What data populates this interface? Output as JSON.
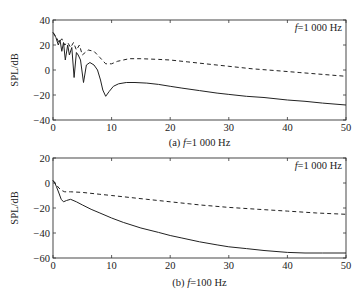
{
  "chart_data": [
    {
      "type": "line",
      "panel": "a",
      "caption_prefix": "(a)",
      "caption_var": "f",
      "caption_value": "=1 000 Hz",
      "annotation_var": "f",
      "annotation_value": "=1 000 Hz",
      "xlabel": "",
      "ylabel": "SPL/dB",
      "xlim": [
        0,
        50
      ],
      "ylim": [
        -40,
        40
      ],
      "xticks": [
        0,
        10,
        20,
        30,
        40,
        50
      ],
      "yticks": [
        -40,
        -20,
        0,
        20,
        40
      ],
      "grid": false,
      "series": [
        {
          "name": "solid",
          "style": "solid",
          "x": [
            0,
            0.5,
            0.9,
            1.2,
            1.5,
            1.8,
            2.1,
            2.5,
            2.8,
            3.2,
            3.6,
            4.0,
            4.3,
            4.7,
            5.2,
            5.7,
            6.3,
            7.0,
            7.6,
            8.1,
            8.5,
            9.0,
            9.6,
            10.3,
            11.2,
            12.5,
            14,
            16,
            18,
            20,
            22,
            25,
            28,
            30,
            33,
            36,
            40,
            43,
            46,
            50
          ],
          "y": [
            30,
            26,
            20,
            24,
            15,
            22,
            8,
            20,
            12,
            18,
            -6,
            14,
            12,
            8,
            -10,
            4,
            6,
            4,
            0,
            -8,
            -16,
            -21,
            -17,
            -13,
            -11,
            -10,
            -10,
            -10.5,
            -11.5,
            -13,
            -14.5,
            -16.5,
            -18.5,
            -19.5,
            -21,
            -22,
            -24,
            -25,
            -26.5,
            -28
          ]
        },
        {
          "name": "dashed",
          "style": "dashed",
          "x": [
            0,
            0.5,
            1.0,
            1.5,
            2.0,
            2.5,
            3.0,
            3.5,
            4.0,
            4.5,
            5.0,
            5.5,
            6,
            7,
            8,
            9,
            10,
            11,
            12,
            13,
            15,
            18,
            20,
            23,
            26,
            30,
            34,
            38,
            42,
            46,
            50
          ],
          "y": [
            30,
            27,
            22,
            25,
            20,
            22,
            18,
            22,
            16,
            20,
            12,
            14,
            16,
            15,
            10,
            5,
            5,
            7,
            8,
            9,
            9,
            8.5,
            8,
            6.5,
            5,
            3,
            1,
            -0.5,
            -2,
            -3.5,
            -5
          ]
        }
      ]
    },
    {
      "type": "line",
      "panel": "b",
      "caption_prefix": "(b)",
      "caption_var": "f",
      "caption_value": "=100 Hz",
      "annotation_var": "f",
      "annotation_value": "=1 000 Hz",
      "xlabel": "",
      "ylabel": "SPL/dB",
      "xlim": [
        0,
        50
      ],
      "ylim": [
        -60,
        20
      ],
      "xticks": [
        0,
        10,
        20,
        30,
        40,
        50
      ],
      "yticks": [
        -60,
        -40,
        -20,
        0,
        20
      ],
      "grid": false,
      "series": [
        {
          "name": "solid",
          "style": "solid",
          "x": [
            0,
            0.3,
            0.6,
            1.0,
            1.4,
            1.8,
            2.3,
            3.0,
            4.0,
            5.0,
            6.5,
            8,
            10,
            12,
            15,
            18,
            20,
            22,
            25,
            28,
            30,
            33,
            36,
            40,
            43,
            46,
            50
          ],
          "y": [
            2,
            0,
            -3,
            -8,
            -13,
            -15,
            -14,
            -13,
            -15,
            -17.5,
            -21,
            -24,
            -28,
            -31.5,
            -36,
            -39.5,
            -42,
            -44,
            -47,
            -49.5,
            -51,
            -52.5,
            -54,
            -55.5,
            -56,
            -56,
            -56
          ]
        },
        {
          "name": "dashed",
          "style": "dashed",
          "x": [
            0,
            0.5,
            1.0,
            1.5,
            2.0,
            3,
            5,
            8,
            10,
            13,
            16,
            20,
            25,
            30,
            35,
            40,
            45,
            50
          ],
          "y": [
            2,
            -1,
            -4,
            -6,
            -7,
            -7,
            -7.5,
            -9,
            -10,
            -11.5,
            -13,
            -15,
            -17.5,
            -19.5,
            -21,
            -22.5,
            -24,
            -25
          ]
        }
      ]
    }
  ]
}
